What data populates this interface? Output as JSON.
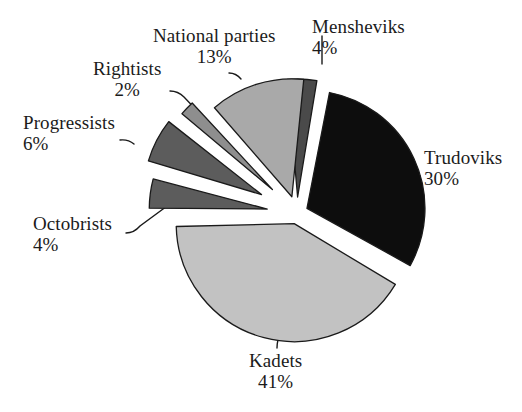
{
  "chart_data": {
    "type": "pie",
    "title": "",
    "subtitle": "",
    "xlabel": "",
    "ylabel": "",
    "legend_position": "none",
    "grid": false,
    "value_unit": "percent",
    "total": 100,
    "categories": [
      "Mensheviks",
      "Trudoviks",
      "Kadets",
      "Octobrists",
      "Progressists",
      "Rightists",
      "National parties"
    ],
    "values": [
      4,
      30,
      41,
      4,
      6,
      2,
      13
    ],
    "slices": [
      {
        "id": "mensheviks",
        "label": "Mensheviks",
        "value": 4,
        "value_label": "4%",
        "color": "#4a4a4a",
        "exploded": true,
        "start_angle": -5,
        "end_angle": 9.4,
        "offset": 16,
        "label_x": 312,
        "label_y": 16,
        "align": "left",
        "leader": "M 322 64 L 322 46 L 322 36"
      },
      {
        "id": "trudoviks",
        "label": "Trudoviks",
        "value": 30,
        "value_label": "30%",
        "color": "#0d0d0d",
        "exploded": true,
        "start_angle": 11,
        "end_angle": 119,
        "offset": 11,
        "label_x": 424,
        "label_y": 147,
        "align": "left",
        "leader": "M 406 185 Q 414 184 420 176"
      },
      {
        "id": "kadets",
        "label": "Kadets",
        "value": 41,
        "value_label": "41%",
        "color": "#c2c2c2",
        "exploded": true,
        "start_angle": 121,
        "end_angle": 268.6,
        "offset": 11,
        "label_x": 249,
        "label_y": 350,
        "align": "center",
        "leader": "M 281 331 Q 277 340 277 348"
      },
      {
        "id": "octobrists",
        "label": "Octobrists",
        "value": 4,
        "value_label": "4%",
        "color": "#5c5c5c",
        "exploded": true,
        "start_angle": 270.4,
        "end_angle": 284.8,
        "offset": 30,
        "label_x": 33,
        "label_y": 213,
        "align": "left",
        "leader": "M 126 233 Q 134 233 140 226 L 178 198"
      },
      {
        "id": "progressists",
        "label": "Progressists",
        "value": 6,
        "value_label": "6%",
        "color": "#5c5c5c",
        "exploded": true,
        "start_angle": 286.6,
        "end_angle": 308.2,
        "offset": 40,
        "label_x": 23,
        "label_y": 112,
        "align": "left",
        "leader": "M 120 140 Q 128 139 134 144"
      },
      {
        "id": "rightists",
        "label": "Rightists",
        "value": 2,
        "value_label": "2%",
        "color": "#8e8e8e",
        "exploded": true,
        "start_angle": 310,
        "end_angle": 317.2,
        "offset": 34,
        "label_x": 93,
        "label_y": 58,
        "align": "center",
        "leader": "M 170 91 Q 178 91 184 97 L 222 137"
      },
      {
        "id": "national-parties",
        "label": "National parties",
        "value": 13,
        "value_label": "13%",
        "color": "#a9a9a9",
        "exploded": true,
        "start_angle": 319,
        "end_angle": 365.8,
        "offset": 17,
        "label_x": 153,
        "label_y": 25,
        "align": "center",
        "leader": "M 229 73 Q 236 73 241 79"
      }
    ],
    "geometry": {
      "cx": 297,
      "cy": 213,
      "radius": 118,
      "stroke_color": "#1a1a1a",
      "stroke_width": 1.3,
      "background": "#ffffff",
      "start_offset_deg": -5
    }
  }
}
